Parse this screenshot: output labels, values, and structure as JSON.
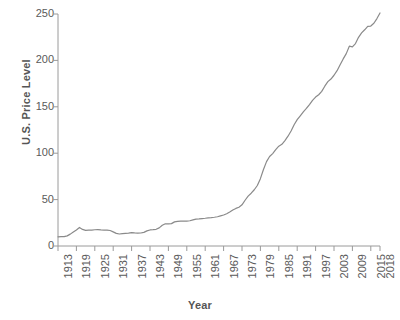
{
  "chart_data": {
    "type": "line",
    "title": "",
    "xlabel": "Year",
    "ylabel": "U.S. Price Level",
    "xlim": [
      1913,
      2018
    ],
    "ylim": [
      0,
      250
    ],
    "grid": false,
    "legend": "none",
    "line_color": "#8a8a8a",
    "xticks": [
      "1913",
      "1919",
      "1925",
      "1931",
      "1937",
      "1943",
      "1949",
      "1955",
      "1961",
      "1967",
      "1973",
      "1979",
      "1985",
      "1991",
      "1997",
      "2003",
      "2009",
      "2015",
      "2018"
    ],
    "yticks": [
      "0",
      "50",
      "100",
      "150",
      "200",
      "250"
    ],
    "series": [
      {
        "name": "U.S. Price Level",
        "x": [
          1913,
          1914,
          1915,
          1916,
          1917,
          1918,
          1919,
          1920,
          1921,
          1922,
          1923,
          1924,
          1925,
          1926,
          1927,
          1928,
          1929,
          1930,
          1931,
          1932,
          1933,
          1934,
          1935,
          1936,
          1937,
          1938,
          1939,
          1940,
          1941,
          1942,
          1943,
          1944,
          1945,
          1946,
          1947,
          1948,
          1949,
          1950,
          1951,
          1952,
          1953,
          1954,
          1955,
          1956,
          1957,
          1958,
          1959,
          1960,
          1961,
          1962,
          1963,
          1964,
          1965,
          1966,
          1967,
          1968,
          1969,
          1970,
          1971,
          1972,
          1973,
          1974,
          1975,
          1976,
          1977,
          1978,
          1979,
          1980,
          1981,
          1982,
          1983,
          1984,
          1985,
          1986,
          1987,
          1988,
          1989,
          1990,
          1991,
          1992,
          1993,
          1994,
          1995,
          1996,
          1997,
          1998,
          1999,
          2000,
          2001,
          2002,
          2003,
          2004,
          2005,
          2006,
          2007,
          2008,
          2009,
          2010,
          2011,
          2012,
          2013,
          2014,
          2015,
          2016,
          2017,
          2018
        ],
        "values": [
          9.9,
          10.0,
          10.1,
          10.9,
          12.8,
          15.1,
          17.3,
          20.0,
          17.9,
          16.8,
          17.1,
          17.1,
          17.5,
          17.7,
          17.4,
          17.2,
          17.2,
          16.7,
          15.2,
          13.6,
          12.9,
          13.4,
          13.7,
          13.9,
          14.4,
          14.1,
          13.9,
          14.0,
          14.7,
          16.3,
          17.3,
          17.6,
          18.0,
          19.5,
          22.3,
          24.0,
          23.8,
          24.1,
          26.0,
          26.6,
          26.8,
          26.9,
          26.8,
          27.2,
          28.1,
          28.9,
          29.2,
          29.6,
          29.9,
          30.3,
          30.6,
          31.0,
          31.5,
          32.5,
          33.4,
          34.8,
          36.7,
          38.8,
          40.5,
          41.8,
          44.4,
          49.3,
          53.8,
          56.9,
          60.6,
          65.2,
          72.6,
          82.4,
          90.9,
          96.5,
          99.6,
          103.9,
          107.6,
          109.6,
          113.6,
          118.3,
          124.0,
          130.7,
          136.2,
          140.3,
          144.5,
          148.2,
          152.4,
          156.9,
          160.5,
          163.0,
          166.6,
          172.2,
          177.1,
          179.9,
          184.0,
          188.9,
          195.3,
          201.6,
          207.3,
          215.3,
          214.5,
          218.1,
          224.9,
          229.6,
          233.0,
          236.7,
          237.0,
          240.0,
          245.1,
          251.1
        ],
        "key_points": {
          "1913": 9.9,
          "1920_peak": 20.0,
          "1933_trough": 12.9,
          "1973": 44.4,
          "1980": 82.4,
          "1990": 130.7,
          "2009_dip": 214.5,
          "2015": 237.0
        }
      }
    ]
  }
}
